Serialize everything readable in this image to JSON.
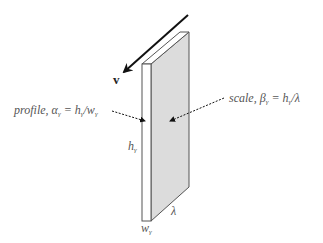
{
  "diagram": {
    "velocity_label": "v",
    "profile_label": {
      "prefix": "profile, ",
      "symbol": "α",
      "subscript": "γ",
      "equals": " = ",
      "num": "h",
      "num_sub": "γ",
      "slash": "/",
      "den": "w",
      "den_sub": "γ"
    },
    "scale_label": {
      "prefix": "scale, ",
      "symbol": "β",
      "subscript": "γ",
      "equals": " = ",
      "num": "h",
      "num_sub": "γ",
      "slash": "/",
      "den": "λ"
    },
    "height_label": {
      "base": "h",
      "sub": "γ"
    },
    "length_label": "λ",
    "width_label": {
      "base": "w",
      "sub": "γ"
    },
    "colors": {
      "face_fill": "#dcdcdc",
      "edge_stroke": "#555555",
      "arrow": "#111111",
      "text": "#555555"
    }
  }
}
